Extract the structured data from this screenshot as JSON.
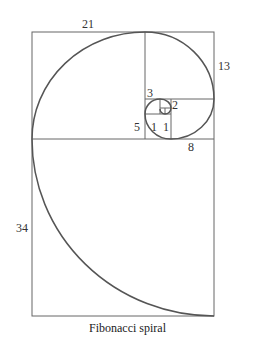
{
  "diagram": {
    "caption": "Fibonacci spiral",
    "labels": {
      "s21": "21",
      "s13": "13",
      "s8": "8",
      "s5": "5",
      "s3": "3",
      "s2": "2",
      "s1a": "1",
      "s1b": "1",
      "s34": "34"
    },
    "colors": {
      "line": "#555555",
      "spiral": "#555555",
      "text": "#333333"
    }
  }
}
